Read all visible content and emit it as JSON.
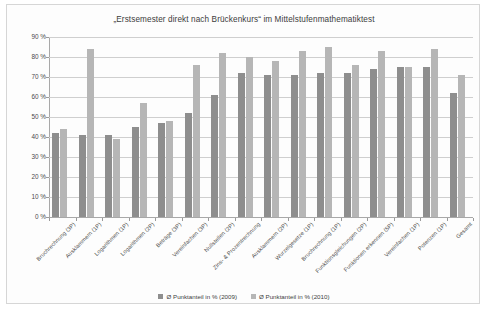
{
  "chart_data": {
    "type": "bar",
    "title": "„Erstsemester direkt nach Brückenkurs“ im Mittelstufenmathematiktest",
    "xlabel": "",
    "ylabel": "",
    "ylim": [
      0,
      90
    ],
    "ytick_labels": [
      "90 %",
      "80 %",
      "70 %",
      "60 %",
      "50 %",
      "40 %",
      "30 %",
      "20 %",
      "10 %",
      "0 %"
    ],
    "ytick_values": [
      90,
      80,
      70,
      60,
      50,
      40,
      30,
      20,
      10,
      0
    ],
    "grid": true,
    "legend_position": "bottom",
    "categories": [
      "Bruchrechnung (3P)",
      "Ausklammern (1P)",
      "Logarithmen (1P)",
      "Logarithmen (2P)",
      "Beträge (3P)",
      "Vereinfachen (3P)",
      "Nullstellen (2P)",
      "Zins- & Prozentrechnung",
      "Ausklammern (2P)",
      "Wurzelgesetze (1P)",
      "Bruchrechnung (1P)",
      "Funktionsgleichungen (2P)",
      "Funktionen erkennen (5P)",
      "Vereinfachen (1P)",
      "Potenzen (1P)",
      "Gesamt"
    ],
    "series": [
      {
        "name": "Ø Punktanteil in % (2009)",
        "color": "#8e8e8e",
        "values": [
          42,
          41,
          41,
          45,
          47,
          52,
          61,
          72,
          71,
          71,
          72,
          72,
          74,
          75,
          75,
          62
        ]
      },
      {
        "name": "Ø Punktanteil in % (2010)",
        "color": "#b6b6b6",
        "values": [
          44,
          84,
          39,
          57,
          48,
          76,
          82,
          80,
          78,
          83,
          85,
          76,
          83,
          75,
          84,
          71
        ]
      }
    ]
  },
  "legend": {
    "items": [
      {
        "label": "Ø Punktanteil in % (2009)",
        "color": "#8e8e8e"
      },
      {
        "label": "Ø Punktanteil in % (2010)",
        "color": "#b6b6b6"
      }
    ]
  }
}
